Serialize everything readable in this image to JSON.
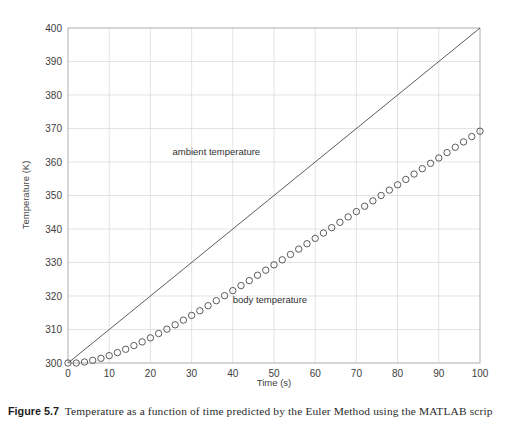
{
  "figure": {
    "caption_label": "Figure 5.7",
    "caption_text": "Temperature as a function of time predicted by the Euler Method using the MATLAB scrip"
  },
  "chart_data": {
    "type": "line",
    "title": "",
    "xlabel": "Time (s)",
    "ylabel": "Temperature (K)",
    "xlim": [
      0,
      100
    ],
    "ylim": [
      300,
      400
    ],
    "xticks": [
      0,
      10,
      20,
      30,
      40,
      50,
      60,
      70,
      80,
      90,
      100
    ],
    "yticks": [
      300,
      310,
      320,
      330,
      340,
      350,
      360,
      370,
      380,
      390,
      400
    ],
    "grid": true,
    "legend": "none",
    "annotations": [
      {
        "text": "ambient temperature",
        "x": 36,
        "y": 362
      },
      {
        "text": "body temperature",
        "x": 49,
        "y": 318
      }
    ],
    "series": [
      {
        "name": "ambient temperature",
        "style": "solid-line",
        "marker": "none",
        "color": "#4a4a4a",
        "x": [
          0,
          100
        ],
        "values": [
          300,
          400
        ]
      },
      {
        "name": "body temperature",
        "style": "markers",
        "marker": "open-circle",
        "color": "#4a4a4a",
        "x": [
          0,
          2,
          4,
          6,
          8,
          10,
          12,
          14,
          16,
          18,
          20,
          22,
          24,
          26,
          28,
          30,
          32,
          34,
          36,
          38,
          40,
          42,
          44,
          46,
          48,
          50,
          52,
          54,
          56,
          58,
          60,
          62,
          64,
          66,
          68,
          70,
          72,
          74,
          76,
          78,
          80,
          82,
          84,
          86,
          88,
          90,
          92,
          94,
          96,
          98,
          100
        ],
        "values": [
          300.0,
          300.0,
          300.3,
          300.8,
          301.4,
          302.2,
          303.1,
          304.1,
          305.2,
          306.3,
          307.5,
          308.8,
          310.1,
          311.4,
          312.8,
          314.2,
          315.6,
          317.1,
          318.6,
          320.1,
          321.6,
          323.1,
          324.6,
          326.2,
          327.7,
          329.3,
          330.8,
          332.4,
          334.0,
          335.6,
          337.2,
          338.8,
          340.4,
          342.0,
          343.6,
          345.2,
          346.8,
          348.4,
          350.0,
          351.6,
          353.2,
          354.8,
          356.4,
          358.0,
          359.6,
          361.2,
          362.8,
          364.4,
          366.0,
          367.6,
          369.2
        ]
      }
    ]
  }
}
